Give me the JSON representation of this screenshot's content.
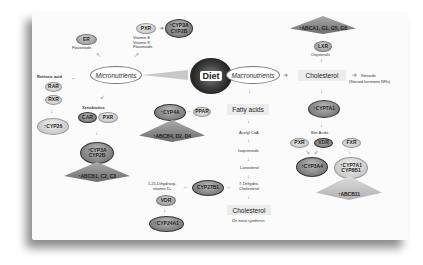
{
  "center": {
    "diet": "Diet",
    "micronutrients": "Micronutrients",
    "macronutrients": "Macronutrients"
  },
  "micro": {
    "er": "ER",
    "flavonoids": "Flavonoids",
    "pxr_top": "PXR",
    "vitamins": [
      "Vitamin E",
      "Vitamin K",
      "Flavonoids"
    ],
    "cyp3a_top": [
      "CYP3A",
      "CYP2B"
    ],
    "retinoic_acid": "Retinoic acid",
    "rar": "RAR",
    "rxr": "RXR",
    "cyp26": "CYP26",
    "xenobiotics": "Xenobiotics",
    "car": "CAR",
    "pxr_mid": "PXR",
    "cyp3a_mid": [
      "CYP3A",
      "CYP2B"
    ],
    "abcb1": "ABCB1, C2, C3"
  },
  "macro": {
    "cyp4a": "CYP4A",
    "ppar": "PPAR",
    "abcb4": "ABCB4, D2, D4",
    "fatty_acids": "Fatty acids",
    "pathway": [
      "Acetyl CoA",
      "Isoprenoids",
      "Lanosterol",
      "7-Dehydro-",
      "Cholesterol"
    ],
    "cholesterol_bottom": "Cholesterol",
    "de_novo": "De novo synthesis",
    "cyp27b1": "CYP27B1",
    "dihydroxy": [
      "1,25-Dihydroxy-",
      "vitamin D₃"
    ],
    "vdr_left": "VDR",
    "cyp24a1": "CYP24A1"
  },
  "chol": {
    "abca1": "ABCA1, G1, G5, G8",
    "lxr": "LXR",
    "oxysterols": "Oxysterols",
    "cholesterol": "Cholesterol",
    "steroids": "Steroids",
    "steroid_note": "(Steroid hormone NRs)",
    "cyp7a1": "CYP7A1",
    "bile_acids": "Bile Acids",
    "pxr": "PXR",
    "vdr": "VDR",
    "fxr": "FXR",
    "cyp3a4": "CYP3A4",
    "cyp7a1_b": [
      "CYP7A1",
      "CYP8B1"
    ],
    "abcb11": "ABCB11"
  },
  "up_arrow": "↑"
}
